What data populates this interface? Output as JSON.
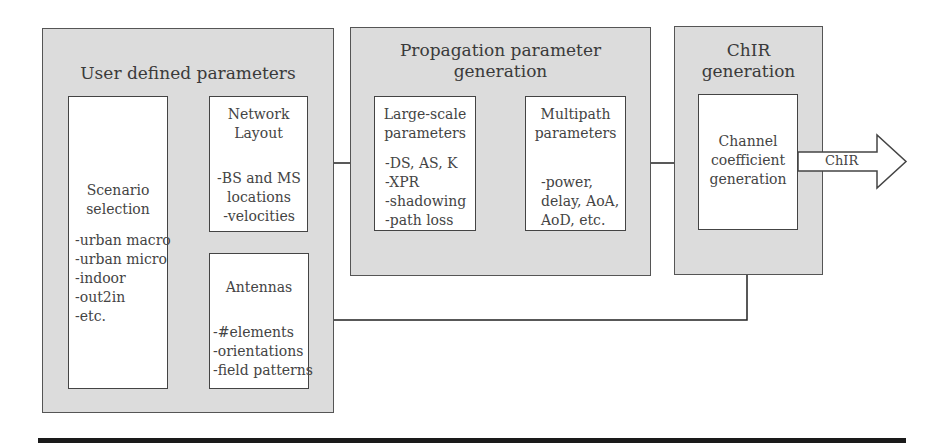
{
  "diagram": {
    "groups": [
      {
        "id": "user-defined",
        "title": "User defined parameters",
        "boxes": [
          {
            "id": "scenario",
            "title": [
              "Scenario",
              "selection"
            ],
            "items": [
              "-urban macro",
              "-urban micro",
              "-indoor",
              "-out2in",
              "-etc."
            ]
          },
          {
            "id": "network-layout",
            "title": [
              "Network",
              "Layout"
            ],
            "items": [
              "-BS and MS",
              "locations",
              "-velocities"
            ]
          },
          {
            "id": "antennas",
            "title": [
              "Antennas"
            ],
            "items": [
              "-#elements",
              "-orientations",
              "-field patterns"
            ]
          }
        ]
      },
      {
        "id": "propagation",
        "title": [
          "Propagation parameter",
          "generation"
        ],
        "boxes": [
          {
            "id": "large-scale",
            "title": [
              "Large-scale",
              "parameters"
            ],
            "items": [
              "-DS, AS, K",
              "-XPR",
              "-shadowing",
              "-path loss"
            ]
          },
          {
            "id": "multipath",
            "title": [
              "Multipath",
              "parameters"
            ],
            "items": [
              "-power,",
              "delay, AoA,",
              "AoD, etc."
            ]
          }
        ]
      },
      {
        "id": "chir",
        "title": [
          "ChIR",
          "generation"
        ],
        "boxes": [
          {
            "id": "channel-coefficient",
            "title": [
              "Channel",
              "coefficient",
              "generation"
            ],
            "items": []
          }
        ]
      }
    ],
    "output_arrow_label": "ChIR",
    "connections": [
      {
        "from": "scenario",
        "to": "network-layout",
        "style": "solid"
      },
      {
        "from": "scenario",
        "to": "antennas",
        "style": "dashed"
      },
      {
        "from": "network-layout",
        "to": "large-scale",
        "style": "solid"
      },
      {
        "from": "large-scale",
        "to": "multipath",
        "style": "solid"
      },
      {
        "from": "multipath",
        "to": "channel-coefficient",
        "style": "solid"
      },
      {
        "from": "antennas",
        "to": "channel-coefficient",
        "style": "solid"
      },
      {
        "from": "channel-coefficient",
        "to": "output",
        "style": "block-arrow",
        "label": "ChIR"
      }
    ]
  }
}
